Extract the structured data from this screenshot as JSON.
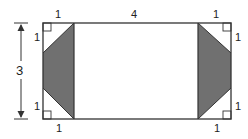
{
  "diagram": {
    "dimensions": {
      "width_label": "4",
      "height_label": "3"
    },
    "corner_labels": {
      "top_left_horizontal": "1",
      "top_left_vertical": "1",
      "top_right_horizontal": "1",
      "top_right_vertical": "1",
      "bottom_left_horizontal": "1",
      "bottom_left_vertical": "1",
      "bottom_right_horizontal": "1",
      "bottom_right_vertical": "1"
    },
    "colors": {
      "stroke": "#333333",
      "shade": "#707070",
      "background": "#ffffff"
    }
  }
}
